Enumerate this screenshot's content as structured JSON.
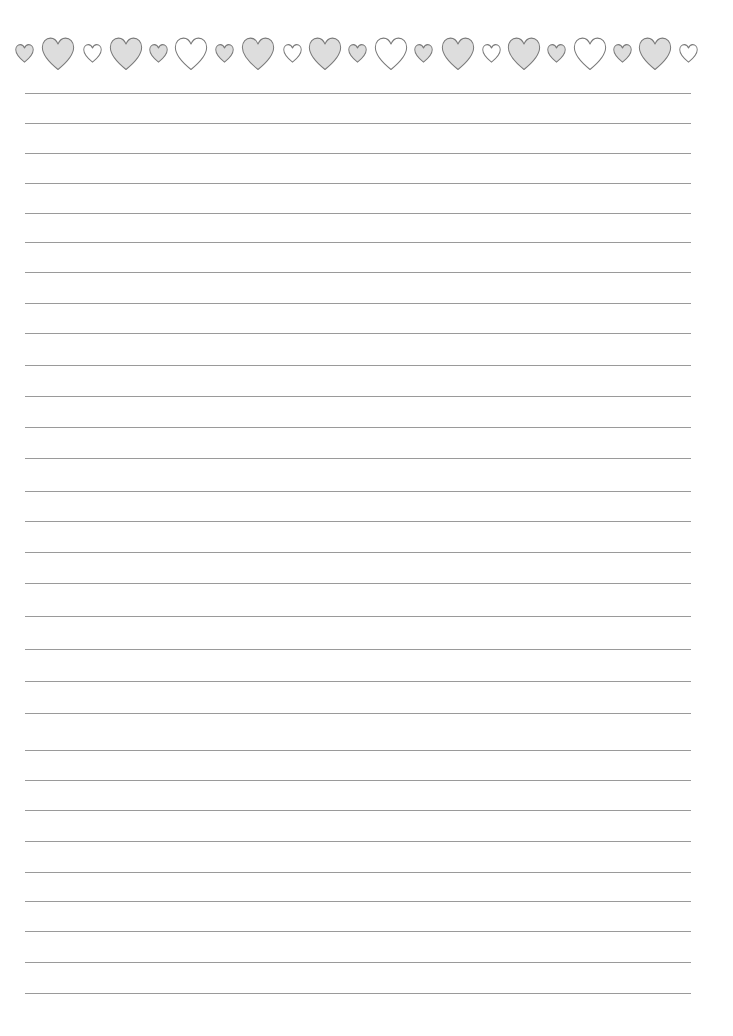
{
  "page": {
    "type": "lined-writing-paper",
    "background": "#ffffff"
  },
  "colors": {
    "heart_stroke": "#7a7a7a",
    "heart_fill_gray": "#dddddd",
    "heart_fill_white": "#ffffff",
    "rule": "#9a9a9a"
  },
  "border": {
    "icon": "heart-icon",
    "hearts": [
      {
        "cx": 24,
        "size": "small",
        "fill": "gray"
      },
      {
        "cx": 58,
        "size": "big",
        "fill": "gray"
      },
      {
        "cx": 92,
        "size": "small",
        "fill": "white"
      },
      {
        "cx": 126,
        "size": "big",
        "fill": "gray"
      },
      {
        "cx": 158,
        "size": "small",
        "fill": "gray"
      },
      {
        "cx": 191,
        "size": "big",
        "fill": "white"
      },
      {
        "cx": 224,
        "size": "small",
        "fill": "gray"
      },
      {
        "cx": 258,
        "size": "big",
        "fill": "gray"
      },
      {
        "cx": 292,
        "size": "small",
        "fill": "white"
      },
      {
        "cx": 325,
        "size": "big",
        "fill": "gray"
      },
      {
        "cx": 357,
        "size": "small",
        "fill": "gray"
      },
      {
        "cx": 391,
        "size": "big",
        "fill": "white"
      },
      {
        "cx": 423,
        "size": "small",
        "fill": "gray"
      },
      {
        "cx": 458,
        "size": "big",
        "fill": "gray"
      },
      {
        "cx": 491,
        "size": "small",
        "fill": "white"
      },
      {
        "cx": 524,
        "size": "big",
        "fill": "gray"
      },
      {
        "cx": 556,
        "size": "small",
        "fill": "gray"
      },
      {
        "cx": 590,
        "size": "big",
        "fill": "white"
      },
      {
        "cx": 622,
        "size": "small",
        "fill": "gray"
      },
      {
        "cx": 655,
        "size": "big",
        "fill": "gray"
      },
      {
        "cx": 688,
        "size": "small",
        "fill": "white"
      }
    ]
  },
  "rules": {
    "x_start": 25,
    "x_end": 691,
    "y": [
      93,
      123,
      153,
      183,
      213,
      242,
      272,
      303,
      333,
      365,
      396,
      427,
      458,
      491,
      521,
      552,
      583,
      616,
      649,
      681,
      713,
      750,
      780,
      810,
      841,
      872,
      901,
      931,
      962,
      993
    ]
  }
}
